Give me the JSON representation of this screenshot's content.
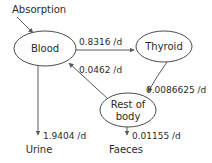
{
  "diagram": {
    "type": "compartment-flow-diagram",
    "background_color": "#ffffff",
    "stroke_color": "#5a5a5a",
    "text_color": "#2b2b2b",
    "nodes": [
      {
        "id": "blood",
        "label": "Blood",
        "shape": "ellipse"
      },
      {
        "id": "thyroid",
        "label": "Thyroid",
        "shape": "ellipse"
      },
      {
        "id": "rest",
        "label_line1": "Rest of",
        "label_line2": "body",
        "shape": "ellipse"
      }
    ],
    "sources": [
      {
        "id": "absorption",
        "label": "Absorption",
        "target": "blood"
      }
    ],
    "sinks": [
      {
        "id": "urine",
        "label": "Urine"
      },
      {
        "id": "faeces",
        "label": "Faeces"
      }
    ],
    "edges": [
      {
        "id": "blood-thyroid",
        "from": "Blood",
        "to": "Thyroid",
        "rate": "0.8316 /d"
      },
      {
        "id": "rest-blood",
        "from": "Rest of body",
        "to": "Blood",
        "rate": "0.0462 /d"
      },
      {
        "id": "thyroid-rest",
        "from": "Thyroid",
        "to": "Rest of body",
        "rate": "0.0086625 /d"
      },
      {
        "id": "blood-urine",
        "from": "Blood",
        "to": "Urine",
        "rate": "1.9404 /d"
      },
      {
        "id": "rest-faeces",
        "from": "Rest of body",
        "to": "Faeces",
        "rate": "0.01155 /d"
      }
    ]
  }
}
